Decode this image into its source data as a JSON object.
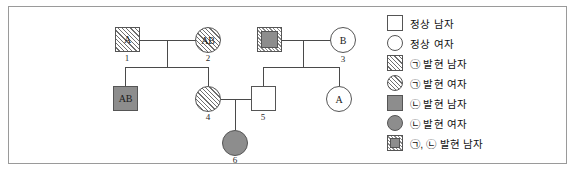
{
  "pedigree": {
    "individuals": [
      {
        "id": "i1",
        "label": "A",
        "number": "1",
        "sex": "male",
        "shape": "square",
        "fill": "hatch",
        "note": "generation-1 father"
      },
      {
        "id": "i2",
        "label": "AB",
        "number": "2",
        "sex": "female",
        "shape": "circle",
        "fill": "hatch",
        "note": "generation-1 mother"
      },
      {
        "id": "i3m",
        "label": "",
        "number": "",
        "sex": "male",
        "shape": "square",
        "fill": "dual",
        "note": "generation-1 father right couple"
      },
      {
        "id": "i3",
        "label": "B",
        "number": "3",
        "sex": "female",
        "shape": "circle",
        "fill": "none",
        "note": "generation-1 mother right couple"
      },
      {
        "id": "i4a",
        "label": "AB",
        "number": "",
        "sex": "male",
        "shape": "square",
        "fill": "gray",
        "note": "generation-2 son of 1 and 2"
      },
      {
        "id": "i4",
        "label": "",
        "number": "4",
        "sex": "female",
        "shape": "circle",
        "fill": "hatch",
        "note": "generation-2 daughter of 1 and 2"
      },
      {
        "id": "i5",
        "label": "",
        "number": "5",
        "sex": "male",
        "shape": "square",
        "fill": "none",
        "note": "generation-2 son of right couple"
      },
      {
        "id": "i5b",
        "label": "A",
        "number": "",
        "sex": "female",
        "shape": "circle",
        "fill": "none",
        "note": "generation-2 daughter of right couple"
      },
      {
        "id": "i6",
        "label": "",
        "number": "6",
        "sex": "female",
        "shape": "circle",
        "fill": "gray",
        "note": "generation-3 daughter of 4 and 5"
      }
    ]
  },
  "legend": {
    "items": [
      {
        "symbol": "square-open",
        "label": "정상 남자"
      },
      {
        "symbol": "circle-open",
        "label": "정상 여자"
      },
      {
        "symbol": "square-hatched",
        "label": "㉠ 발현 남자"
      },
      {
        "symbol": "circle-hatched",
        "label": "㉠ 발현 여자"
      },
      {
        "symbol": "square-filled",
        "label": "㉡ 발현 남자"
      },
      {
        "symbol": "circle-filled",
        "label": "㉡ 발현 여자"
      },
      {
        "symbol": "square-dual",
        "label": "㉠, ㉡ 발현 남자"
      }
    ]
  },
  "colors": {
    "line": "#4a4a4a",
    "fill_gray": "#8d8d8d",
    "border": "#9a9a9a",
    "text": "#111111"
  }
}
